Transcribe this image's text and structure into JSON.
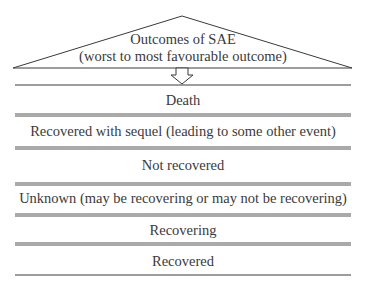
{
  "header": {
    "line1": "Outcomes of SAE",
    "line2": "(worst to most favourable outcome)"
  },
  "outcomes": [
    {
      "label": "Death"
    },
    {
      "label": "Recovered with sequel (leading to some other event)"
    },
    {
      "label": "Not recovered"
    },
    {
      "label": "Unknown (may be recovering or may not be recovering)"
    },
    {
      "label": "Recovering"
    },
    {
      "label": "Recovered"
    }
  ],
  "colors": {
    "line": "#3a3a3a",
    "text": "#3a3a3a"
  }
}
